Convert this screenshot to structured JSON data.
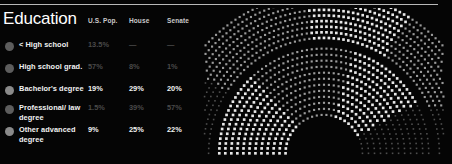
{
  "panel": {
    "background_color": "#050505",
    "rule_color": "#b8b8b8"
  },
  "header": {
    "title": "Education",
    "columns": [
      {
        "key": "us_pop",
        "label": "U.S. Pop."
      },
      {
        "key": "house",
        "label": "House"
      },
      {
        "key": "senate",
        "label": "Senate"
      }
    ]
  },
  "colors": {
    "text_bright": "#f2f2f2",
    "text_dim": "#4a4a4a",
    "bullet_bright": "#8a8a8a",
    "bullet_dim": "#5d5d5d",
    "dot_bright": "#e8e8e8",
    "dot_mid": "#9a9a9a",
    "dot_dark": "#4e4e4e"
  },
  "rows": [
    {
      "label": "< High school",
      "us_pop": "13.5%",
      "house": "—",
      "senate": "—",
      "emphasis": "dim"
    },
    {
      "label": "High school grad.",
      "us_pop": "57%",
      "house": "8%",
      "senate": "1%",
      "emphasis": "dim"
    },
    {
      "label": "Bachelor's degree",
      "us_pop": "19%",
      "house": "29%",
      "senate": "20%",
      "emphasis": "bright"
    },
    {
      "label": "Professional/ law degree",
      "us_pop": "1.5%",
      "house": "39%",
      "senate": "57%",
      "emphasis": "dim"
    },
    {
      "label": "Other advanced degree",
      "us_pop": "9%",
      "house": "25%",
      "senate": "22%",
      "emphasis": "bright"
    }
  ],
  "chart_data": {
    "type": "hemicycle-dot-matrix",
    "title": "",
    "bands": [
      {
        "name": "outer-band",
        "inner_radius": 108,
        "outer_radius": 150,
        "rows": 9,
        "segments": [
          {
            "name": "left-dark",
            "start_deg": 180,
            "end_deg": 148,
            "brightness": "dark"
          },
          {
            "name": "left-mid",
            "start_deg": 148,
            "end_deg": 96,
            "brightness": "mid"
          },
          {
            "name": "top-bright",
            "start_deg": 96,
            "end_deg": 58,
            "brightness": "bright"
          },
          {
            "name": "right-mid",
            "start_deg": 58,
            "end_deg": 22,
            "brightness": "mid"
          },
          {
            "name": "right-dark",
            "start_deg": 22,
            "end_deg": 0,
            "brightness": "dark"
          }
        ]
      },
      {
        "name": "inner-band",
        "inner_radius": 36,
        "outer_radius": 98,
        "rows": 12,
        "segments": [
          {
            "name": "left-bright",
            "start_deg": 180,
            "end_deg": 132,
            "brightness": "bright"
          },
          {
            "name": "center-mid",
            "start_deg": 132,
            "end_deg": 74,
            "brightness": "mid"
          },
          {
            "name": "right-bright",
            "start_deg": 74,
            "end_deg": 28,
            "brightness": "bright"
          },
          {
            "name": "right-dark",
            "start_deg": 28,
            "end_deg": 0,
            "brightness": "dark"
          }
        ]
      }
    ],
    "center": {
      "x": 108,
      "y": 136
    },
    "legend_position": "left-table"
  }
}
